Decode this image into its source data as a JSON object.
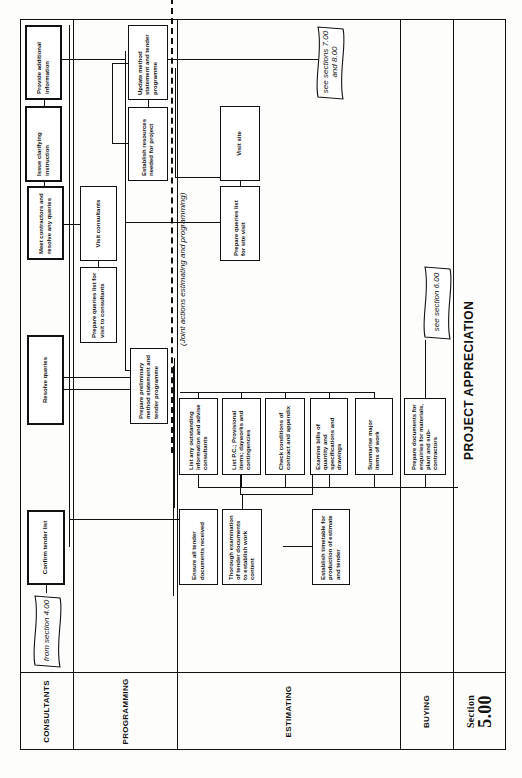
{
  "document": {
    "title": "PROJECT APPRECIATION",
    "section": {
      "label": "Section",
      "number": "5.00"
    },
    "orientation": "rotated 90° counter-clockwise",
    "lanes": [
      {
        "id": "consultants",
        "label": "CONSULTANTS"
      },
      {
        "id": "programming",
        "label": "PROGRAMMING"
      },
      {
        "id": "estimating",
        "label": "ESTIMATING"
      },
      {
        "id": "buying",
        "label": "BUYING"
      }
    ],
    "connectors": {
      "from_section": "from section 4.00",
      "see_sections_7_8": "see sections 7.00 and 8.00",
      "see_section_6": "see section 6.00"
    },
    "joint_actions_note": "(Joint actions estimating and programming)",
    "boxes": {
      "confirm_tender_list": "Confirm tender list",
      "resolve_queries": "Resolve queries",
      "meet_contractors": "Meet contractors and resolve any queries",
      "issue_clarifying": "Issue clarifying instruction",
      "provide_additional": "Provide additional information",
      "prepare_preliminary": "Prepare preliminary method statement and tender programme",
      "prepare_queries_consultants": "Prepare queries list for visit to consultants",
      "visit_consultants": "Visit consultants",
      "establish_resources": "Establish resources needed for project",
      "update_method": "Update method statement and tender programme",
      "prepare_queries_site": "Prepare queries list for site visit",
      "visit_site": "Visit site",
      "list_outstanding": "List any outstanding information and advise consultants",
      "list_pc": "List P.C.; Provisional items; dayworks and contingencies",
      "check_conditions": "Check conditions of contract and appendix",
      "examine_bills": "Examine bills of quantity and specifications and drawings",
      "summarise_major": "Summarise major items of work",
      "ensure_documents": "Ensure all tender documents received",
      "thorough_examination": "Thorough examination of tender documents to establish work content",
      "establish_timetable": "Establish timetable for production of estimate and tender",
      "prepare_documents_buying": "Prepare documents for enquiries for materials, plant and sub-contractors"
    }
  }
}
